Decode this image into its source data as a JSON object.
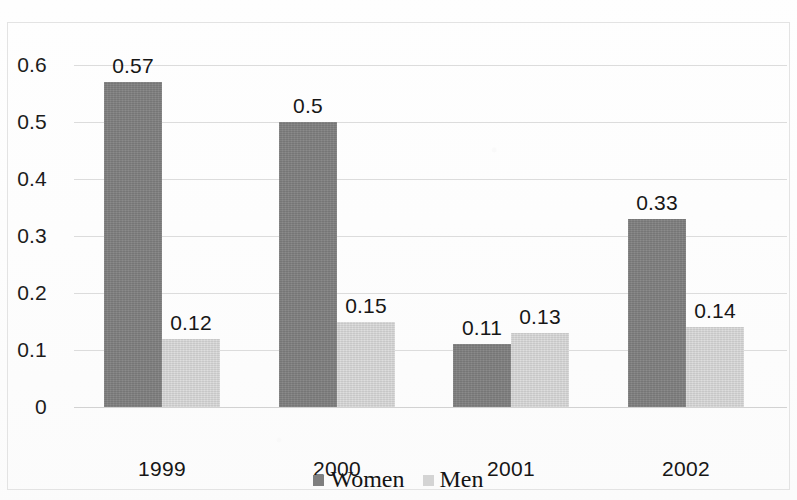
{
  "chart_data": {
    "type": "bar",
    "title": "",
    "subtitle": "",
    "xlabel": "",
    "ylabel": "",
    "categories": [
      "1999",
      "2000",
      "2001",
      "2002"
    ],
    "series": [
      {
        "name": "Women",
        "color": "#7f7f7f",
        "values": [
          0.57,
          0.5,
          0.11,
          0.33
        ],
        "labels": [
          "0.57",
          "0.5",
          "0.11",
          "0.33"
        ]
      },
      {
        "name": "Men",
        "color": "#d4d4d4",
        "values": [
          0.12,
          0.15,
          0.13,
          0.14
        ],
        "labels": [
          "0.12",
          "0.15",
          "0.13",
          "0.14"
        ]
      }
    ],
    "ylim": [
      0,
      0.6
    ],
    "ytick_values": [
      0.6,
      0.5,
      0.4,
      0.3,
      0.2,
      0.1,
      0
    ],
    "ytick_labels": [
      "0.6",
      "0.5",
      "0.4",
      "0.3",
      "0.2",
      "0.1",
      "0"
    ],
    "grid": true,
    "grid_axis": "y",
    "legend": true,
    "legend_position": "bottom-center",
    "data_labels": true,
    "background_color": "#fdfdfd",
    "grid_color": "#dcdcdc",
    "border_color": "#e3e3e3",
    "text_color": "#171717"
  },
  "legend": {
    "entries": [
      {
        "label": "Women",
        "color": "#7f7f7f"
      },
      {
        "label": "Men",
        "color": "#d4d4d4"
      }
    ]
  }
}
